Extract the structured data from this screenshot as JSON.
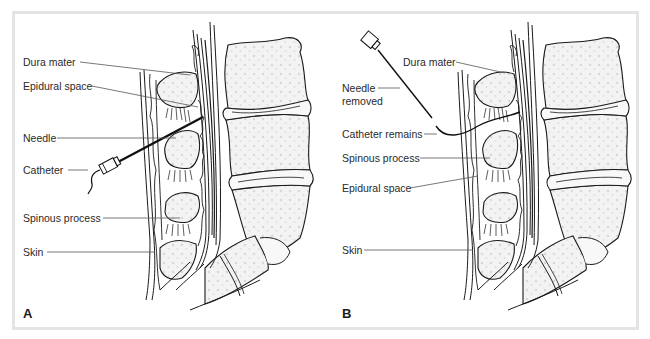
{
  "figure": {
    "panels": [
      {
        "letter": "A",
        "labels": {
          "dura_mater": "Dura mater",
          "epidural_space": "Epidural space",
          "needle": "Needle",
          "catheter": "Catheter",
          "spinous_process": "Spinous process",
          "skin": "Skin"
        }
      },
      {
        "letter": "B",
        "labels": {
          "dura_mater": "Dura mater",
          "needle_removed_line1": "Needle",
          "needle_removed_line2": "removed",
          "catheter_remains": "Catheter remains",
          "spinous_process": "Spinous process",
          "epidural_space": "Epidural space",
          "skin": "Skin"
        }
      }
    ],
    "colors": {
      "frame": "#e4e4e4",
      "line": "#1a1a1a",
      "bone_fill": "#f2f2f2",
      "bone_dots": "#d6d6d6",
      "leader": "#555555"
    }
  }
}
